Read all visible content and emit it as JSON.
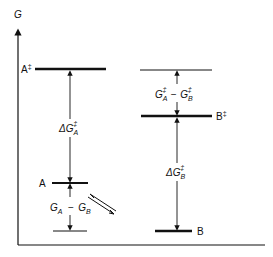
{
  "diagram": {
    "type": "free-energy-level-diagram",
    "axis": {
      "y_label": "G"
    },
    "left_state": {
      "transition_state_label": "A",
      "transition_state_mark": "‡",
      "ground_state_label": "A",
      "barrier_label": {
        "prefix": "ΔG",
        "sub": "A",
        "sup": "‡"
      },
      "difference_label": {
        "g1": "G",
        "g1_sub": "A",
        "minus": "−",
        "g2": "G",
        "g2_sub": "B"
      }
    },
    "right_state": {
      "transition_state_label": "B",
      "transition_state_mark": "‡",
      "ground_state_label": "B",
      "barrier_label": {
        "prefix": "ΔG",
        "sub": "B",
        "sup": "‡"
      },
      "difference_label": {
        "g1": "G",
        "g1_sub": "A",
        "g1_sup": "‡",
        "minus": "−",
        "g2": "G",
        "g2_sub": "B",
        "g2_sup": "‡"
      }
    },
    "equilibrium_symbol": "⇌"
  }
}
